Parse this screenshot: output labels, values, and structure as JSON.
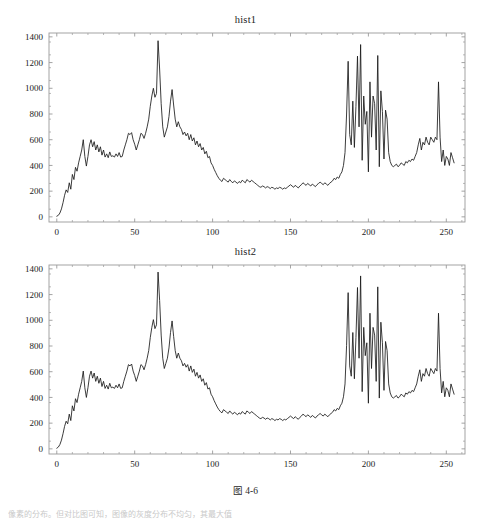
{
  "page": {
    "background_color": "#ffffff",
    "caption": "图 4-6",
    "body_text": "像素的分布。但对比图可知，图像的灰度分布不均匀，其最大值",
    "axis_color": "#9a9a9a",
    "curve_color": "#1a1a1a",
    "text_color": "#1b1b1b"
  },
  "figures": [
    {
      "id": "hist1",
      "title": "hist1",
      "frame": {
        "left": 49,
        "top": 19,
        "right": 465,
        "bottom": 208
      }
    },
    {
      "id": "hist2",
      "title": "hist2",
      "frame": {
        "left": 49,
        "top": 19,
        "right": 465,
        "bottom": 208
      }
    }
  ],
  "chart_data": [
    {
      "type": "line",
      "title": "hist1",
      "xlabel": "",
      "ylabel": "",
      "xlim": [
        -5,
        262
      ],
      "ylim": [
        -40,
        1430
      ],
      "xticks": [
        0,
        50,
        100,
        150,
        200,
        250
      ],
      "xtick_labels": [
        "0",
        "50",
        "100",
        "150",
        "200",
        "250"
      ],
      "yticks": [
        0,
        200,
        400,
        600,
        800,
        1000,
        1200,
        1400
      ],
      "ytick_labels": [
        "0",
        "200",
        "400",
        "600",
        "800",
        "1000",
        "1200",
        "1400"
      ],
      "grid": false,
      "legend": "none",
      "x": [
        0,
        1,
        2,
        3,
        4,
        5,
        6,
        7,
        8,
        9,
        10,
        11,
        12,
        13,
        14,
        15,
        16,
        17,
        18,
        19,
        20,
        21,
        22,
        23,
        24,
        25,
        26,
        27,
        28,
        29,
        30,
        31,
        32,
        33,
        34,
        35,
        36,
        37,
        38,
        39,
        40,
        41,
        42,
        43,
        44,
        45,
        46,
        47,
        48,
        49,
        50,
        51,
        52,
        53,
        54,
        55,
        56,
        57,
        58,
        59,
        60,
        61,
        62,
        63,
        64,
        65,
        66,
        67,
        68,
        69,
        70,
        71,
        72,
        73,
        74,
        75,
        76,
        77,
        78,
        79,
        80,
        81,
        82,
        83,
        84,
        85,
        86,
        87,
        88,
        89,
        90,
        91,
        92,
        93,
        94,
        95,
        96,
        97,
        98,
        99,
        100,
        101,
        102,
        103,
        104,
        105,
        106,
        107,
        108,
        109,
        110,
        111,
        112,
        113,
        114,
        115,
        116,
        117,
        118,
        119,
        120,
        121,
        122,
        123,
        124,
        125,
        126,
        127,
        128,
        129,
        130,
        131,
        132,
        133,
        134,
        135,
        136,
        137,
        138,
        139,
        140,
        141,
        142,
        143,
        144,
        145,
        146,
        147,
        148,
        149,
        150,
        151,
        152,
        153,
        154,
        155,
        156,
        157,
        158,
        159,
        160,
        161,
        162,
        163,
        164,
        165,
        166,
        167,
        168,
        169,
        170,
        171,
        172,
        173,
        174,
        175,
        176,
        177,
        178,
        179,
        180,
        181,
        182,
        183,
        184,
        185,
        186,
        187,
        188,
        189,
        190,
        191,
        192,
        193,
        194,
        195,
        196,
        197,
        198,
        199,
        200,
        201,
        202,
        203,
        204,
        205,
        206,
        207,
        208,
        209,
        210,
        211,
        212,
        213,
        214,
        215,
        216,
        217,
        218,
        219,
        220,
        221,
        222,
        223,
        224,
        225,
        226,
        227,
        228,
        229,
        230,
        231,
        232,
        233,
        234,
        235,
        236,
        237,
        238,
        239,
        240,
        241,
        242,
        243,
        244,
        245,
        246,
        247,
        248,
        249,
        250,
        251,
        252,
        253,
        254,
        255
      ],
      "values": [
        5,
        12,
        30,
        62,
        110,
        168,
        210,
        190,
        265,
        215,
        330,
        290,
        385,
        355,
        420,
        470,
        520,
        600,
        470,
        395,
        470,
        560,
        600,
        545,
        585,
        520,
        560,
        505,
        545,
        480,
        520,
        465,
        490,
        460,
        505,
        470,
        475,
        465,
        490,
        470,
        500,
        465,
        470,
        520,
        560,
        600,
        650,
        640,
        655,
        600,
        565,
        520,
        560,
        600,
        650,
        640,
        610,
        650,
        700,
        760,
        860,
        940,
        1000,
        930,
        960,
        1370,
        1150,
        880,
        700,
        620,
        660,
        700,
        780,
        900,
        990,
        870,
        760,
        700,
        740,
        700,
        680,
        640,
        660,
        630,
        650,
        600,
        640,
        590,
        615,
        560,
        590,
        545,
        570,
        520,
        540,
        490,
        510,
        460,
        470,
        420,
        400,
        370,
        345,
        320,
        300,
        285,
        275,
        300,
        290,
        280,
        270,
        290,
        275,
        265,
        280,
        270,
        260,
        275,
        265,
        285,
        275,
        265,
        290,
        280,
        270,
        285,
        275,
        265,
        255,
        245,
        235,
        230,
        240,
        235,
        225,
        235,
        230,
        220,
        230,
        225,
        215,
        225,
        220,
        230,
        225,
        215,
        225,
        220,
        230,
        240,
        250,
        240,
        230,
        245,
        235,
        225,
        240,
        250,
        265,
        255,
        245,
        260,
        250,
        240,
        255,
        245,
        235,
        250,
        260,
        270,
        260,
        250,
        265,
        255,
        245,
        260,
        270,
        280,
        300,
        290,
        310,
        300,
        330,
        350,
        400,
        500,
        800,
        1210,
        640,
        560,
        900,
        540,
        860,
        1250,
        700,
        1340,
        440,
        940,
        720,
        820,
        350,
        1050,
        620,
        940,
        880,
        520,
        1255,
        390,
        980,
        820,
        450,
        830,
        760,
        500,
        430,
        400,
        390,
        400,
        410,
        390,
        400,
        420,
        410,
        400,
        430,
        420,
        440,
        430,
        450,
        440,
        470,
        500,
        560,
        610,
        520,
        580,
        560,
        620,
        580,
        560,
        620,
        600,
        580,
        620,
        600,
        1050,
        620,
        430,
        520,
        400,
        470,
        450,
        400,
        500,
        460,
        420,
        510,
        400,
        640,
        480,
        420,
        340,
        320,
        300,
        280,
        260,
        250,
        240,
        230,
        225,
        220,
        230,
        260,
        285,
        280,
        260,
        200,
        120,
        60,
        20,
        5,
        0,
        -5,
        -8,
        -10,
        -12
      ]
    },
    {
      "type": "line",
      "title": "hist2",
      "xlabel": "",
      "ylabel": "",
      "xlim": [
        -5,
        262
      ],
      "ylim": [
        -40,
        1430
      ],
      "xticks": [
        0,
        50,
        100,
        150,
        200,
        250
      ],
      "xtick_labels": [
        "0",
        "50",
        "100",
        "150",
        "200",
        "250"
      ],
      "yticks": [
        0,
        200,
        400,
        600,
        800,
        1000,
        1200,
        1400
      ],
      "ytick_labels": [
        "0",
        "200",
        "400",
        "600",
        "800",
        "1000",
        "1200",
        "1400"
      ],
      "grid": false,
      "legend": "none",
      "x": [
        0,
        1,
        2,
        3,
        4,
        5,
        6,
        7,
        8,
        9,
        10,
        11,
        12,
        13,
        14,
        15,
        16,
        17,
        18,
        19,
        20,
        21,
        22,
        23,
        24,
        25,
        26,
        27,
        28,
        29,
        30,
        31,
        32,
        33,
        34,
        35,
        36,
        37,
        38,
        39,
        40,
        41,
        42,
        43,
        44,
        45,
        46,
        47,
        48,
        49,
        50,
        51,
        52,
        53,
        54,
        55,
        56,
        57,
        58,
        59,
        60,
        61,
        62,
        63,
        64,
        65,
        66,
        67,
        68,
        69,
        70,
        71,
        72,
        73,
        74,
        75,
        76,
        77,
        78,
        79,
        80,
        81,
        82,
        83,
        84,
        85,
        86,
        87,
        88,
        89,
        90,
        91,
        92,
        93,
        94,
        95,
        96,
        97,
        98,
        99,
        100,
        101,
        102,
        103,
        104,
        105,
        106,
        107,
        108,
        109,
        110,
        111,
        112,
        113,
        114,
        115,
        116,
        117,
        118,
        119,
        120,
        121,
        122,
        123,
        124,
        125,
        126,
        127,
        128,
        129,
        130,
        131,
        132,
        133,
        134,
        135,
        136,
        137,
        138,
        139,
        140,
        141,
        142,
        143,
        144,
        145,
        146,
        147,
        148,
        149,
        150,
        151,
        152,
        153,
        154,
        155,
        156,
        157,
        158,
        159,
        160,
        161,
        162,
        163,
        164,
        165,
        166,
        167,
        168,
        169,
        170,
        171,
        172,
        173,
        174,
        175,
        176,
        177,
        178,
        179,
        180,
        181,
        182,
        183,
        184,
        185,
        186,
        187,
        188,
        189,
        190,
        191,
        192,
        193,
        194,
        195,
        196,
        197,
        198,
        199,
        200,
        201,
        202,
        203,
        204,
        205,
        206,
        207,
        208,
        209,
        210,
        211,
        212,
        213,
        214,
        215,
        216,
        217,
        218,
        219,
        220,
        221,
        222,
        223,
        224,
        225,
        226,
        227,
        228,
        229,
        230,
        231,
        232,
        233,
        234,
        235,
        236,
        237,
        238,
        239,
        240,
        241,
        242,
        243,
        244,
        245,
        246,
        247,
        248,
        249,
        250,
        251,
        252,
        253,
        254,
        255
      ],
      "values": [
        5,
        14,
        34,
        68,
        118,
        175,
        215,
        195,
        270,
        220,
        335,
        295,
        390,
        360,
        425,
        475,
        525,
        605,
        475,
        400,
        475,
        565,
        605,
        550,
        590,
        525,
        565,
        510,
        550,
        485,
        525,
        470,
        495,
        465,
        510,
        475,
        480,
        470,
        495,
        475,
        505,
        470,
        475,
        525,
        565,
        605,
        655,
        645,
        660,
        605,
        570,
        525,
        565,
        605,
        655,
        645,
        615,
        655,
        705,
        765,
        865,
        945,
        1005,
        935,
        965,
        1375,
        1155,
        885,
        705,
        625,
        665,
        705,
        785,
        905,
        995,
        875,
        765,
        705,
        745,
        705,
        685,
        645,
        665,
        635,
        655,
        605,
        645,
        595,
        620,
        565,
        595,
        550,
        575,
        525,
        545,
        495,
        515,
        465,
        475,
        425,
        405,
        375,
        350,
        325,
        305,
        290,
        280,
        305,
        295,
        285,
        275,
        295,
        280,
        270,
        285,
        275,
        265,
        280,
        270,
        290,
        280,
        270,
        295,
        285,
        275,
        290,
        280,
        270,
        260,
        250,
        240,
        235,
        245,
        240,
        230,
        240,
        235,
        225,
        235,
        230,
        220,
        230,
        225,
        235,
        230,
        220,
        230,
        225,
        235,
        245,
        255,
        245,
        235,
        250,
        240,
        230,
        245,
        255,
        270,
        260,
        250,
        265,
        255,
        245,
        260,
        250,
        240,
        255,
        265,
        275,
        265,
        255,
        270,
        260,
        250,
        265,
        275,
        285,
        305,
        295,
        315,
        305,
        335,
        355,
        405,
        505,
        805,
        1215,
        645,
        565,
        905,
        545,
        865,
        1255,
        705,
        1345,
        445,
        945,
        725,
        825,
        355,
        1055,
        625,
        945,
        885,
        525,
        1260,
        395,
        985,
        825,
        455,
        835,
        765,
        505,
        435,
        405,
        395,
        405,
        415,
        395,
        405,
        425,
        415,
        405,
        435,
        425,
        445,
        435,
        455,
        445,
        475,
        505,
        565,
        615,
        525,
        585,
        565,
        625,
        585,
        565,
        625,
        605,
        585,
        625,
        605,
        1055,
        625,
        435,
        525,
        405,
        475,
        455,
        405,
        505,
        465,
        425,
        515,
        405,
        645,
        485,
        425,
        345,
        325,
        305,
        285,
        265,
        255,
        245,
        235,
        230,
        225,
        235,
        265,
        290,
        285,
        265,
        205,
        125,
        65,
        25,
        8,
        2,
        -3,
        -6,
        -9,
        -11
      ]
    }
  ]
}
